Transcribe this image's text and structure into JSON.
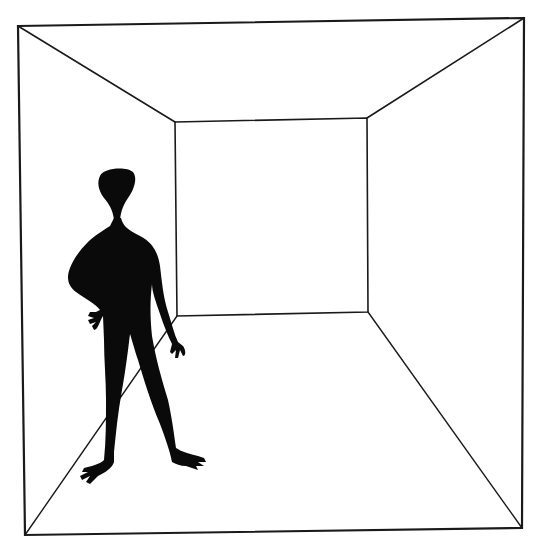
{
  "image": {
    "description": "Line drawing of an empty room in one-point perspective with a black silhouette figure standing on the left",
    "colors": {
      "background": "#ffffff",
      "line": "#1a1a1a",
      "figure": "#0a0a0a"
    }
  },
  "room": {
    "outer": {
      "tl": [
        18,
        26
      ],
      "tr": [
        524,
        18
      ],
      "br": [
        522,
        528
      ],
      "bl": [
        25,
        535
      ]
    },
    "inner": {
      "tl": [
        175,
        122
      ],
      "tr": [
        367,
        118
      ],
      "br": [
        368,
        312
      ],
      "bl": [
        177,
        316
      ]
    }
  },
  "figure": {
    "label": "silhouette-figure"
  }
}
